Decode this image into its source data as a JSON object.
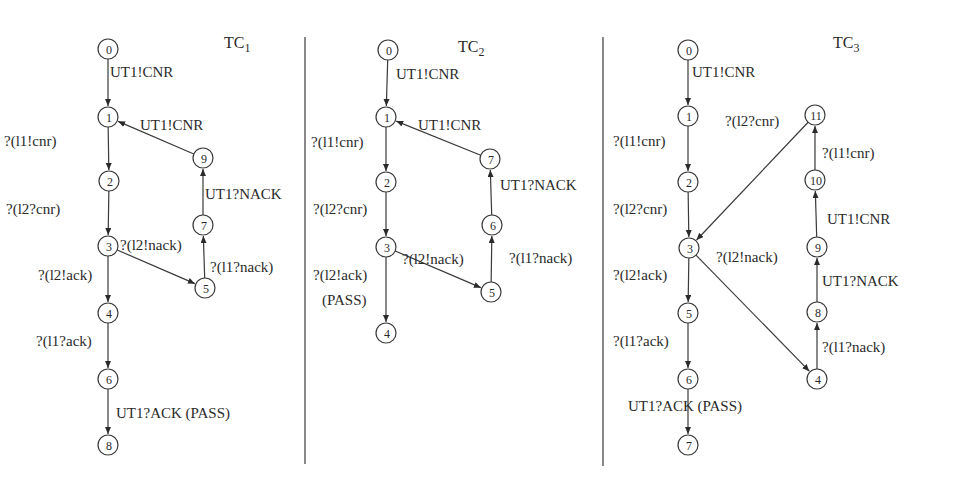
{
  "figure": {
    "type": "state-transition test case diagrams",
    "panels": [
      {
        "id": "tc1",
        "title": "TC",
        "title_subscript": "1",
        "nodes": [
          "0",
          "1",
          "2",
          "3",
          "4",
          "5",
          "6",
          "7",
          "8",
          "9"
        ],
        "edges": [
          {
            "from": "0",
            "to": "1",
            "label": "UT1!CNR"
          },
          {
            "from": "1",
            "to": "2",
            "label": "?(l1!cnr)"
          },
          {
            "from": "2",
            "to": "3",
            "label": "?(l2?cnr)"
          },
          {
            "from": "3",
            "to": "4",
            "label": "?(l2!ack)"
          },
          {
            "from": "4",
            "to": "6",
            "label": "?(l1?ack)"
          },
          {
            "from": "6",
            "to": "8",
            "label": "UT1?ACK (PASS)"
          },
          {
            "from": "3",
            "to": "5",
            "label": "?(l2!nack)"
          },
          {
            "from": "5",
            "to": "7",
            "label": "?(l1?nack)"
          },
          {
            "from": "7",
            "to": "9",
            "label": "UT1?NACK"
          },
          {
            "from": "9",
            "to": "1",
            "label": "UT1!CNR"
          }
        ]
      },
      {
        "id": "tc2",
        "title": "TC",
        "title_subscript": "2",
        "nodes": [
          "0",
          "1",
          "2",
          "3",
          "4",
          "5",
          "6",
          "7"
        ],
        "edges": [
          {
            "from": "0",
            "to": "1",
            "label": "UT1!CNR"
          },
          {
            "from": "1",
            "to": "2",
            "label": "?(l1!cnr)"
          },
          {
            "from": "2",
            "to": "3",
            "label": "?(l2?cnr)"
          },
          {
            "from": "3",
            "to": "4",
            "label": "?(l2!ack)",
            "label2": "(PASS)"
          },
          {
            "from": "3",
            "to": "5",
            "label": "?(l2!nack)"
          },
          {
            "from": "5",
            "to": "6",
            "label": "?(l1?nack)"
          },
          {
            "from": "6",
            "to": "7",
            "label": "UT1?NACK"
          },
          {
            "from": "7",
            "to": "1",
            "label": "UT1!CNR"
          }
        ]
      },
      {
        "id": "tc3",
        "title": "TC",
        "title_subscript": "3",
        "nodes": [
          "0",
          "1",
          "2",
          "3",
          "4",
          "5",
          "6",
          "7",
          "8",
          "9",
          "10",
          "11"
        ],
        "edges": [
          {
            "from": "0",
            "to": "1",
            "label": "UT1!CNR"
          },
          {
            "from": "1",
            "to": "2",
            "label": "?(l1!cnr)"
          },
          {
            "from": "2",
            "to": "3",
            "label": "?(l2?cnr)"
          },
          {
            "from": "3",
            "to": "5",
            "label": "?(l2!ack)"
          },
          {
            "from": "5",
            "to": "6",
            "label": "?(l1?ack)"
          },
          {
            "from": "6",
            "to": "7",
            "label": "UT1?ACK (PASS)"
          },
          {
            "from": "3",
            "to": "4",
            "label": "?(l2!nack)"
          },
          {
            "from": "4",
            "to": "8",
            "label": "?(l1?nack)"
          },
          {
            "from": "8",
            "to": "9",
            "label": "UT1?NACK"
          },
          {
            "from": "9",
            "to": "10",
            "label": "UT1!CNR"
          },
          {
            "from": "10",
            "to": "11",
            "label": "?(l1!cnr)"
          },
          {
            "from": "11",
            "to": "3",
            "label": "?(l2?cnr)"
          }
        ]
      }
    ]
  }
}
